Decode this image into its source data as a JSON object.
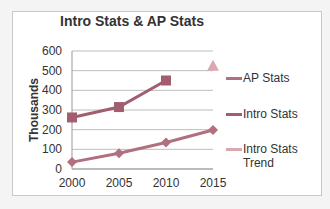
{
  "chart_data": {
    "type": "line",
    "title": "Intro Stats & AP Stats",
    "xlabel": "",
    "ylabel": "Thousands",
    "x": [
      "2000",
      "2005",
      "2010",
      "2015"
    ],
    "yticks": [
      "0",
      "100",
      "200",
      "300",
      "400",
      "500",
      "600"
    ],
    "ylim": [
      0,
      600
    ],
    "grid": true,
    "legend_position": "right",
    "series": [
      {
        "name": "AP Stats",
        "marker": "diamond",
        "color": "#b07080",
        "values": [
          35,
          80,
          135,
          198
        ]
      },
      {
        "name": "Intro Stats",
        "marker": "square",
        "color": "#a25d6e",
        "values": [
          262,
          315,
          450,
          null
        ]
      },
      {
        "name": "Intro Stats Trend",
        "marker": "triangle",
        "color": "#d9a8b0",
        "values": [
          null,
          null,
          null,
          525
        ]
      }
    ]
  },
  "legend": {
    "ap": "AP Stats",
    "intro": "Intro Stats",
    "trend_line1": "Intro Stats",
    "trend_line2": "Trend"
  }
}
